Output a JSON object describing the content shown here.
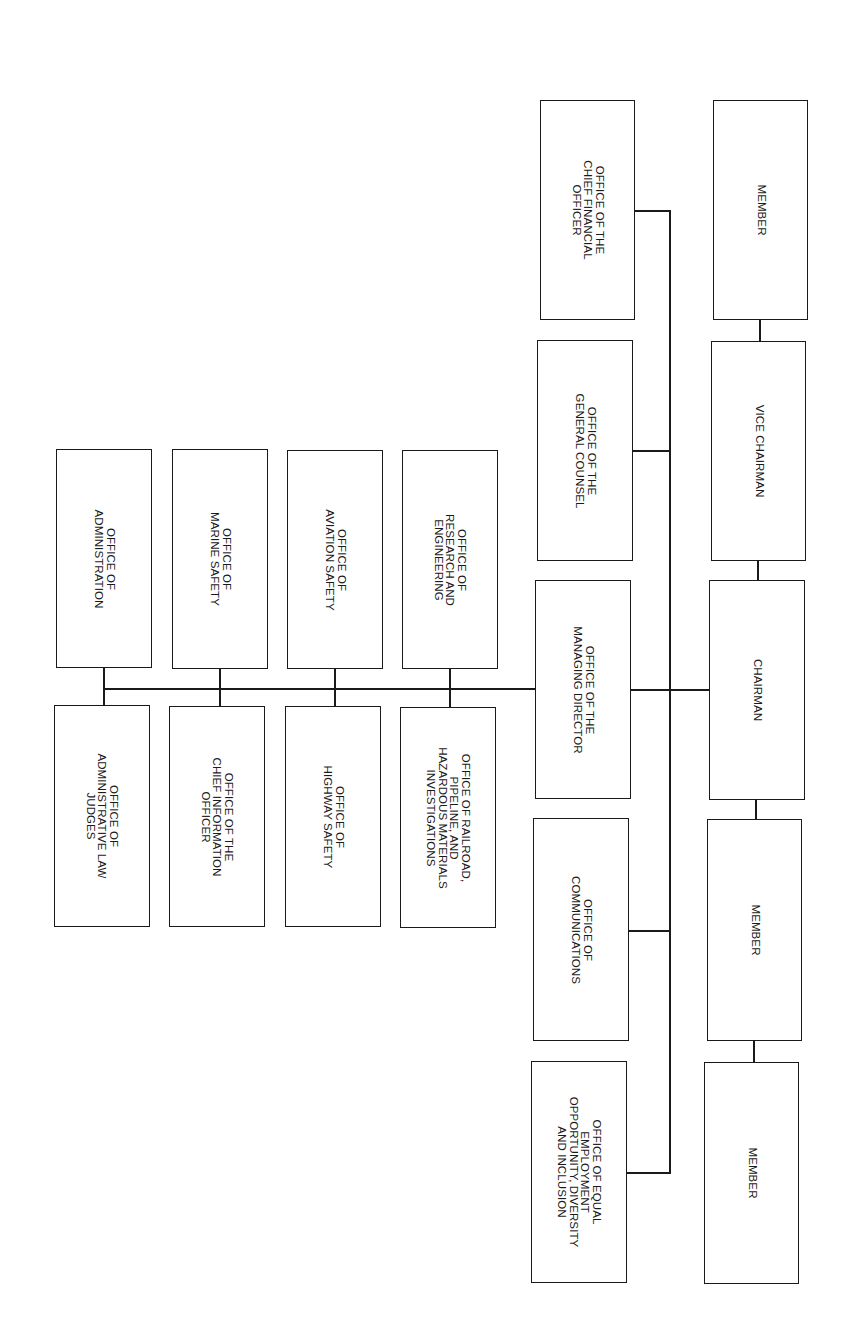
{
  "org_chart": {
    "line_color": "#1a1a1a",
    "box_border_color": "#1a1a1a",
    "text_orientation": "rotated-90-clockwise",
    "boxes": [
      {
        "id": "member-top",
        "label": "MEMBER",
        "x": 713,
        "y": 100,
        "w": 95,
        "h": 220
      },
      {
        "id": "vice-chairman",
        "label": "VICE CHAIRMAN",
        "x": 711,
        "y": 341,
        "w": 95,
        "h": 220
      },
      {
        "id": "chairman",
        "label": "CHAIRMAN",
        "x": 709,
        "y": 580,
        "w": 96,
        "h": 220
      },
      {
        "id": "member-mid",
        "label": "MEMBER",
        "x": 707,
        "y": 819,
        "w": 95,
        "h": 222
      },
      {
        "id": "member-bottom",
        "label": "MEMBER",
        "x": 704,
        "y": 1062,
        "w": 95,
        "h": 222
      },
      {
        "id": "chief-financial-officer",
        "label": "OFFICE OF THE\nCHIEF FINANCIAL\nOFFICER",
        "x": 540,
        "y": 100,
        "w": 95,
        "h": 220
      },
      {
        "id": "general-counsel",
        "label": "OFFICE OF THE\nGENERAL COUNSEL",
        "x": 537,
        "y": 340,
        "w": 96,
        "h": 221
      },
      {
        "id": "managing-director",
        "label": "OFFICE OF THE\nMANAGING DIRECTOR",
        "x": 535,
        "y": 580,
        "w": 96,
        "h": 219
      },
      {
        "id": "communications",
        "label": "OFFICE OF\nCOMMUNICATIONS",
        "x": 533,
        "y": 818,
        "w": 96,
        "h": 223
      },
      {
        "id": "equal-employment",
        "label": "OFFICE OF EQUAL\nEMPLOYMENT\nOPPORTUNITY, DIVERSITY\nAND INCLUSION",
        "x": 531,
        "y": 1061,
        "w": 96,
        "h": 222
      },
      {
        "id": "research-engineering",
        "label": "OFFICE OF\nRESEARCH AND\nENGINEERING",
        "x": 402,
        "y": 450,
        "w": 96,
        "h": 219
      },
      {
        "id": "aviation-safety",
        "label": "OFFICE OF\nAVIATION SAFETY",
        "x": 287,
        "y": 450,
        "w": 96,
        "h": 219
      },
      {
        "id": "marine-safety",
        "label": "OFFICE OF\nMARINE SAFETY",
        "x": 172,
        "y": 449,
        "w": 96,
        "h": 220
      },
      {
        "id": "administration",
        "label": "OFFICE OF\nADMINISTRATION",
        "x": 56,
        "y": 449,
        "w": 96,
        "h": 219
      },
      {
        "id": "railroad-pipeline-hazmat",
        "label": "OFFICE OF RAILROAD,\nPIPELINE, AND\nHAZARDOUS MATERIALS\nINVESTIGATIONS",
        "x": 400,
        "y": 707,
        "w": 96,
        "h": 221
      },
      {
        "id": "highway-safety",
        "label": "OFFICE OF\nHIGHWAY SAFETY",
        "x": 285,
        "y": 706,
        "w": 96,
        "h": 221
      },
      {
        "id": "chief-information-officer",
        "label": "OFFICE OF THE\nCHIEF INFORMATION\nOFFICER",
        "x": 169,
        "y": 706,
        "w": 96,
        "h": 221
      },
      {
        "id": "administrative-law-judges",
        "label": "OFFICE OF\nADMINISTRATIVE LAW\nJUDGES",
        "x": 54,
        "y": 705,
        "w": 96,
        "h": 222
      }
    ],
    "lines": [
      {
        "id": "member-top-to-vice",
        "x": 759,
        "y": 320,
        "w": 2,
        "h": 21
      },
      {
        "id": "vice-to-chairman",
        "x": 757,
        "y": 561,
        "w": 2,
        "h": 19
      },
      {
        "id": "chairman-to-member-mid",
        "x": 755,
        "y": 800,
        "w": 2,
        "h": 19
      },
      {
        "id": "member-mid-to-bottom",
        "x": 753,
        "y": 1041,
        "w": 2,
        "h": 21
      },
      {
        "id": "staff-spine",
        "x": 669,
        "y": 210,
        "w": 2,
        "h": 964
      },
      {
        "id": "spine-to-cfo",
        "x": 635,
        "y": 210,
        "w": 36,
        "h": 2
      },
      {
        "id": "spine-to-general-counsel",
        "x": 633,
        "y": 450,
        "w": 37,
        "h": 2
      },
      {
        "id": "chairman-to-managing-director",
        "x": 631,
        "y": 689,
        "w": 78,
        "h": 2
      },
      {
        "id": "spine-to-communications",
        "x": 629,
        "y": 930,
        "w": 40,
        "h": 2
      },
      {
        "id": "spine-to-equal-employment",
        "x": 627,
        "y": 1172,
        "w": 44,
        "h": 2
      },
      {
        "id": "md-office-bus",
        "x": 103,
        "y": 688,
        "w": 432,
        "h": 2
      },
      {
        "id": "research-drop",
        "x": 449,
        "y": 669,
        "w": 2,
        "h": 38
      },
      {
        "id": "aviation-drop",
        "x": 334,
        "y": 669,
        "w": 2,
        "h": 37
      },
      {
        "id": "marine-drop",
        "x": 219,
        "y": 669,
        "w": 2,
        "h": 37
      },
      {
        "id": "administration-drop",
        "x": 103,
        "y": 668,
        "w": 2,
        "h": 37
      }
    ]
  }
}
